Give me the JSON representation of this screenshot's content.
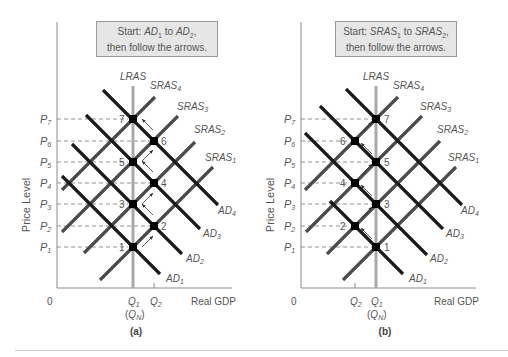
{
  "panels": [
    {
      "id": "a",
      "caption": "(a)",
      "start_note": {
        "line1_prefix": "Start: ",
        "from": "AD",
        "from_sub": "1",
        "mid": " to ",
        "to": "AD",
        "to_sub": "2",
        "suffix": ",",
        "line2": "then follow the arrows."
      },
      "y_axis_label": "Price Level",
      "x_axis_label": "Real GDP",
      "origin_label": "0",
      "lras_label": "LRAS",
      "q_labels": [
        {
          "name": "Q",
          "sub": "1"
        },
        {
          "name": "Q",
          "sub": "2"
        }
      ],
      "qn_label": {
        "name": "Q",
        "sub": "N"
      },
      "price_levels": [
        "P1",
        "P2",
        "P3",
        "P4",
        "P5",
        "P6",
        "P7"
      ],
      "sras_labels": [
        "SRAS1",
        "SRAS2",
        "SRAS3",
        "SRAS4"
      ],
      "ad_labels": [
        "AD1",
        "AD2",
        "AD3",
        "AD4"
      ],
      "points": [
        "1",
        "2",
        "3",
        "4",
        "5",
        "6",
        "7"
      ]
    },
    {
      "id": "b",
      "caption": "(b)",
      "start_note": {
        "line1_prefix": "Start: ",
        "from": "SRAS",
        "from_sub": "1",
        "mid": " to ",
        "to": "SRAS",
        "to_sub": "2",
        "suffix": ",",
        "line2": "then follow the arrows."
      },
      "y_axis_label": "Price Level",
      "x_axis_label": "Real GDP",
      "origin_label": "0",
      "lras_label": "LRAS",
      "q_labels": [
        {
          "name": "Q",
          "sub": "2"
        },
        {
          "name": "Q",
          "sub": "1"
        }
      ],
      "qn_label": {
        "name": "Q",
        "sub": "N"
      },
      "price_levels": [
        "P1",
        "P2",
        "P3",
        "P4",
        "P5",
        "P6",
        "P7"
      ],
      "sras_labels": [
        "SRAS1",
        "SRAS2",
        "SRAS3",
        "SRAS4"
      ],
      "ad_labels": [
        "AD1",
        "AD2",
        "AD3",
        "AD4"
      ],
      "points": [
        "1",
        "2",
        "3",
        "4",
        "5",
        "6",
        "7"
      ]
    }
  ],
  "colors": {
    "ad_line": "#1a1a1a",
    "sras_line": "#4a4a4a",
    "lras_line": "#a8a8a8",
    "axis": "#8a8a8a",
    "dash": "#7a7a7a",
    "text": "#555555",
    "note_bg": "#e6e6e6",
    "note_border": "#9a9a9a"
  }
}
